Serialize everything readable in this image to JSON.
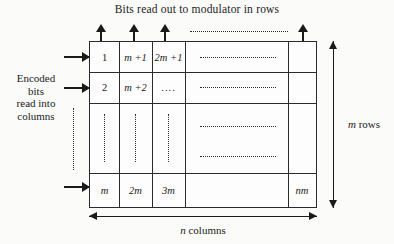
{
  "diagram": {
    "title": "Bits read out to modulator in rows",
    "left_caption": [
      "Encoded",
      "bits",
      "read into",
      "columns"
    ],
    "right_caption": "m rows",
    "right_caption_italic_prefix": "m",
    "right_caption_rest": " rows",
    "bottom_caption": "n columns",
    "bottom_caption_italic_prefix": "n",
    "bottom_caption_rest": " columns"
  },
  "grid": {
    "columns": [
      "col-1",
      "col-2",
      "col-3",
      "col-wide",
      "col-last"
    ],
    "rows": [
      {
        "name": "row-1",
        "cells": [
          "1",
          "m +1",
          "2m +1",
          "dotted-horizontal",
          ""
        ]
      },
      {
        "name": "row-2",
        "cells": [
          "2",
          "m +2",
          "....",
          "dotted-horizontal",
          ""
        ]
      },
      {
        "name": "row-ellipsis",
        "cells": [
          "dotted-vertical",
          "dotted-vertical",
          "dotted-vertical",
          "dotted-horizontal",
          ""
        ]
      },
      {
        "name": "row-last",
        "cells": [
          "m",
          "2m",
          "3m",
          "",
          "nm"
        ]
      }
    ],
    "cell_values": {
      "r1c1": "1",
      "r1c2": "m +1",
      "r1c3": "2m +1",
      "r2c1": "2",
      "r2c2": "m +2",
      "r2c3": "....",
      "r4c1": "m",
      "r4c2": "2m",
      "r4c3": "3m",
      "r4c5": "nm"
    }
  },
  "arrows": {
    "top_out": [
      "out-arrow-col-1",
      "out-arrow-col-2",
      "out-arrow-col-3",
      "out-arrow-col-last"
    ],
    "top_dots": "dotted-line-between-out-arrows",
    "left_in": [
      "in-arrow-row-1",
      "in-arrow-row-2",
      "in-arrow-row-last"
    ],
    "left_dots": "dotted-line-between-in-arrows",
    "rows_measure": "m rows",
    "cols_measure": "n columns"
  },
  "colors": {
    "ink": "#1a1a1a",
    "rule": "#2b2b2b",
    "paper": "#fbfbfa"
  }
}
